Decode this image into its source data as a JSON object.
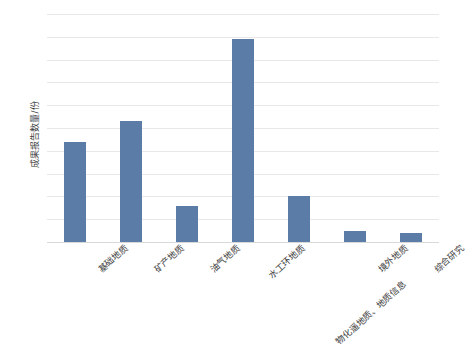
{
  "chart_data": {
    "type": "bar",
    "title": "",
    "xlabel": "",
    "ylabel": "成果报告数量/份",
    "ylim": [
      0,
      100
    ],
    "ytick_step": 10,
    "yticks": [
      0,
      10,
      20,
      30,
      40,
      50,
      60,
      70,
      80,
      90,
      100
    ],
    "categories": [
      "基础地质",
      "矿产地质",
      "油气地质",
      "水工环地质",
      "物化遥地质、地质信息",
      "境外地质",
      "综合研究"
    ],
    "values": [
      44,
      53,
      16,
      89,
      20,
      5,
      4
    ],
    "series": [
      {
        "name": "成果报告数量",
        "values": [
          44,
          53,
          16,
          89,
          20,
          5,
          4
        ]
      }
    ],
    "grid": true,
    "legend": false,
    "legend_position": "none",
    "bar_color": "#5b7ca6",
    "gridline_color": "#e8e8e8",
    "background_color": "#ffffff",
    "label_rotation_deg": -42
  },
  "clipped_title_fragment": "",
  "axis": {
    "y_title": "成果报告数量/份"
  }
}
